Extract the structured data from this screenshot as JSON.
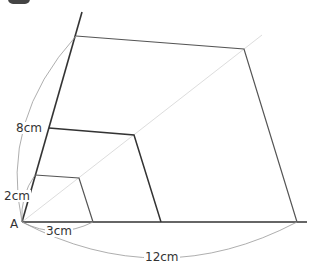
{
  "figure": {
    "type": "similar-figures enlargement diagram",
    "center_point": "A",
    "labels": {
      "point_a": "A",
      "small_side_horizontal": "3cm",
      "small_side_vertical": "2cm",
      "medium_side_vertical": "8cm",
      "large_side_horizontal": "12cm"
    },
    "colors": {
      "stroke": "#333333",
      "guide": "#dddddd",
      "arc": "#999999",
      "text": "#333333"
    }
  }
}
